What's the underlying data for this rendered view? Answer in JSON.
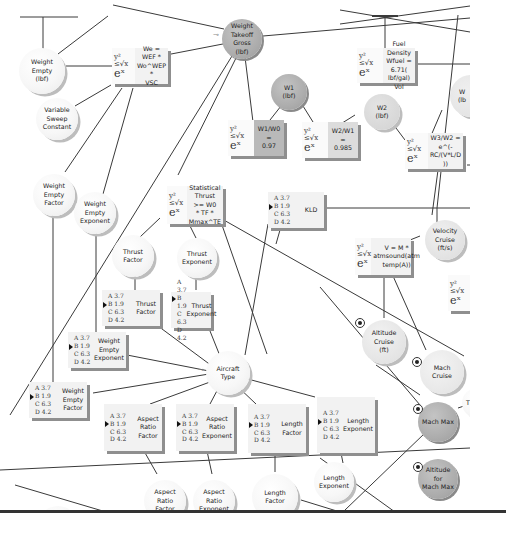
{
  "diagram": {
    "nodes": {
      "weight_empty": {
        "label": "Weight Empty\n(lbf)",
        "l1": "Weight Empty",
        "l2": "(lbf)"
      },
      "weight_takeoff_gross": {
        "l1": "Weight",
        "l2": "Takeoff Gross",
        "l3": "(lbf)"
      },
      "variable_sweep_constant": {
        "l1": "Variable",
        "l2": "Sweep",
        "l3": "Constant"
      },
      "weight_empty_factor": {
        "l1": "Weight Empty",
        "l2": "Factor"
      },
      "weight_empty_exponent": {
        "l1": "Weight Empty",
        "l2": "Exponent"
      },
      "w1": {
        "l1": "W1",
        "l2": "(lbf)"
      },
      "w2": {
        "l1": "W2",
        "l2": "(lbf)"
      },
      "w3": {
        "l1": "W",
        "l2": "(lb"
      },
      "thrust_factor": {
        "l1": "Thrust Factor"
      },
      "thrust_exponent": {
        "l1": "Thrust",
        "l2": "Exponent"
      },
      "aircraft_type": {
        "l1": "Aircraft Type"
      },
      "velocity_cruise": {
        "l1": "Velocity",
        "l2": "Cruise",
        "l3": "(ft/s)"
      },
      "altitude_cruise": {
        "l1": "Altitude Cruise",
        "l2": "(ft)"
      },
      "mach_cruise": {
        "l1": "Mach Cruise"
      },
      "mach_max": {
        "l1": "Mach Max"
      },
      "altitude_mach_max": {
        "l1": "Altitude for",
        "l2": "Mach Max"
      },
      "aspect_ratio_factor": {
        "l1": "Aspect Ratio",
        "l2": "Factor"
      },
      "aspect_ratio_exponent": {
        "l1": "Aspect Ratio",
        "l2": "Exponent"
      },
      "length_factor": {
        "l1": "Length Factor"
      },
      "length_exponent": {
        "l1": "Length",
        "l2": "Exponent"
      }
    },
    "functions": {
      "we": {
        "l1": "We = WEF *",
        "l2": "Wo^WEP *",
        "l3": "VSC"
      },
      "fuel": {
        "l1": "Fuel Density",
        "l2": "Wfuel = 6.71(",
        "l3": "lbf/gal) Vol"
      },
      "w1w0": {
        "l1": "W1/W0 =",
        "l2": "0.97"
      },
      "w2w1": {
        "l1": "W2/W1 =",
        "l2": "0.985"
      },
      "w3w2": {
        "l1": "W3/W2 =",
        "l2": "e^(-RC/(V*L/D",
        "l3": "))"
      },
      "thrust": {
        "l1": "Statistical",
        "l2": "Thrust >= W0",
        "l3": "* TF *",
        "l4": "Mmax^TE"
      },
      "velocity": {
        "l1": "V = M *",
        "l2": "atmsound(atm",
        "l3": "temp(A))"
      },
      "partial_right": {
        "l1": "Th",
        "l2": "Te",
        "l3": "0.",
        "l4": "9"
      }
    },
    "symbol": {
      "top": "y²",
      "mid": "≤√x",
      "bot": "eˣ"
    },
    "tables": {
      "options": [
        "A 3.7",
        "B 1.9",
        "C 6.3",
        "D 4.2"
      ],
      "selected_index": 1,
      "kld": "KLD",
      "thrust_factor": "Thrust Factor",
      "thrust_exponent": {
        "l1": "Thrust",
        "l2": "Exponent"
      },
      "weight_empty_exponent": {
        "l1": "Weight Empty",
        "l2": "Exponent"
      },
      "weight_empty_factor": {
        "l1": "Weight Empty",
        "l2": "Factor"
      },
      "aspect_ratio_factor": {
        "l1": "Aspect Ratio",
        "l2": "Factor"
      },
      "aspect_ratio_exponent": {
        "l1": "Aspect Ratio",
        "l2": "Exponent"
      },
      "length_factor": "Length Factor",
      "length_exponent": {
        "l1": "Length",
        "l2": "Exponent"
      }
    },
    "partial_right_node": {
      "l1": "Th"
    }
  }
}
